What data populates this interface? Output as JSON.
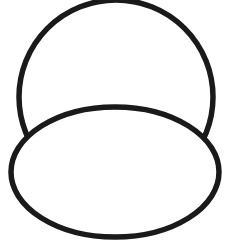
{
  "canvas": {
    "width": 236,
    "height": 247,
    "background_color": "#ffffff",
    "title": "Two overlapping outline shapes",
    "description": "A black line drawing of a large circle with an ellipse overlapping its lower portion, the ellipse drawn in front with an opaque white interior."
  },
  "style": {
    "stroke_color": "#1a1a1a",
    "fill_color": "#ffffff",
    "stroke_width": 5.5,
    "stroke_linejoin": "round",
    "stroke_linecap": "round"
  },
  "shapes": [
    {
      "name": "upper-circle",
      "type": "circle",
      "cx": 116,
      "cy": 97,
      "r": 97,
      "bounds": {
        "left": 19,
        "top": 0,
        "right": 213,
        "bottom": 194
      },
      "z_order": 1,
      "occluded": true,
      "fill": "#ffffff",
      "stroke": "#1a1a1a"
    },
    {
      "name": "lower-ellipse",
      "type": "ellipse",
      "cx": 115,
      "cy": 172,
      "rx": 104,
      "ry": 65,
      "bounds": {
        "left": 11,
        "top": 107,
        "right": 219,
        "bottom": 237
      },
      "z_order": 2,
      "occluded": false,
      "fill": "#ffffff",
      "stroke": "#1a1a1a"
    }
  ],
  "intersections": [
    {
      "name": "left-intersection",
      "x": 20,
      "y": 140
    },
    {
      "name": "right-intersection",
      "x": 206,
      "y": 140
    }
  ]
}
